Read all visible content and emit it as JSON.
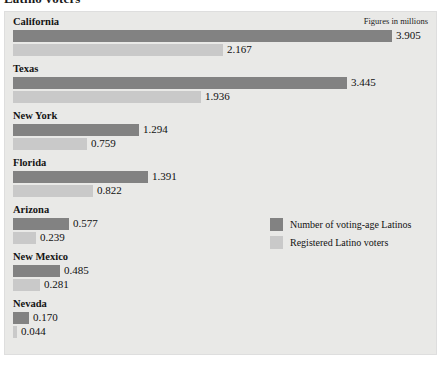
{
  "title": "Latino voters",
  "figures_note": "Figures in millions",
  "legend": {
    "items": [
      {
        "key": "voting_age",
        "label": "Number of voting-age Latinos",
        "color": "#828282"
      },
      {
        "key": "registered",
        "label": "Registered Latino voters",
        "color": "#c9c9c9"
      }
    ]
  },
  "chart_data": {
    "type": "bar",
    "orientation": "horizontal",
    "title": "Latino voters",
    "subtitle": "Figures in millions",
    "xlabel": "",
    "ylabel": "",
    "unit": "millions",
    "grid": false,
    "legend_position": "center-right",
    "xlim": [
      0,
      3.905
    ],
    "categories": [
      "California",
      "Texas",
      "New York",
      "Florida",
      "Arizona",
      "New Mexico",
      "Nevada"
    ],
    "series": [
      {
        "name": "Number of voting-age Latinos",
        "color": "#828282",
        "values": [
          3.905,
          3.445,
          1.294,
          1.391,
          0.577,
          0.485,
          0.17
        ],
        "labels": [
          "3.905",
          "3.445",
          "1.294",
          "1.391",
          "0.577",
          "0.485",
          "0.170"
        ]
      },
      {
        "name": "Registered Latino voters",
        "color": "#c9c9c9",
        "values": [
          2.167,
          1.936,
          0.759,
          0.822,
          0.239,
          0.281,
          0.044
        ],
        "labels": [
          "2.167",
          "1.936",
          "0.759",
          "0.822",
          "0.239",
          "0.281",
          "0.044"
        ]
      }
    ]
  },
  "rows": [
    {
      "state": "California",
      "dark": "3.905",
      "light": "2.167"
    },
    {
      "state": "Texas",
      "dark": "3.445",
      "light": "1.936"
    },
    {
      "state": "New York",
      "dark": "1.294",
      "light": "0.759"
    },
    {
      "state": "Florida",
      "dark": "1.391",
      "light": "0.822"
    },
    {
      "state": "Arizona",
      "dark": "0.577",
      "light": "0.239"
    },
    {
      "state": "New Mexico",
      "dark": "0.485",
      "light": "0.281"
    },
    {
      "state": "Nevada",
      "dark": "0.170",
      "light": "0.044"
    }
  ]
}
